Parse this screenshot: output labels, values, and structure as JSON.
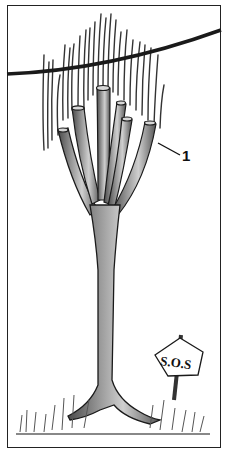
{
  "illustration": {
    "subject": "pollarded-tree-near-overhead-wire",
    "callout_label": "1",
    "sign_text": "S.O.S",
    "colors": {
      "ink": "#1a1a1a",
      "trunk_fill": "#8a8a8a",
      "trunk_light": "#c4c4c4",
      "sign_fill": "#ffffff",
      "grass": "#555555",
      "frame": "#222222"
    }
  }
}
